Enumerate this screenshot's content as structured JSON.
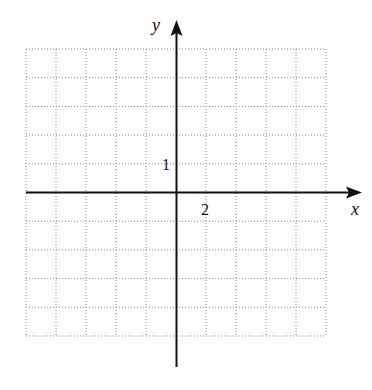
{
  "figure": {
    "type": "coordinate-grid",
    "grid": {
      "columns": 10,
      "rows": 10,
      "line_style": "dotted",
      "line_color": "#8a8a8a"
    },
    "axes": {
      "x_label": "x",
      "y_label": "y",
      "axis_color": "#111111",
      "x_tick_label": "2",
      "y_tick_label": "1",
      "x_scale_per_gridline": 2,
      "y_scale_per_gridline": 1
    }
  }
}
